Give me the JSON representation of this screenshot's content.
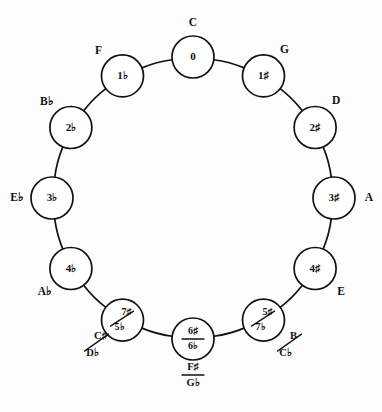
{
  "diagram": {
    "type": "circle-of-fifths",
    "title": "",
    "background_color": "#fdfdfd",
    "stroke_color": "#111111",
    "node_fill": "#ffffff",
    "geometry": {
      "center_x": 193,
      "center_y": 198,
      "ring_radius": 141,
      "node_radius": 21
    },
    "nodes": [
      {
        "id": "c",
        "accidentals": "0",
        "accidentals_second": "",
        "divider": "none",
        "key_label": "C",
        "key_label_second": "",
        "key_divider": "none",
        "angle_deg": 0,
        "label_position": "above"
      },
      {
        "id": "g",
        "accidentals": "1♯",
        "accidentals_second": "",
        "divider": "none",
        "key_label": "G",
        "key_label_second": "",
        "key_divider": "none",
        "angle_deg": 30,
        "label_position": "above-right"
      },
      {
        "id": "d",
        "accidentals": "2♯",
        "accidentals_second": "",
        "divider": "none",
        "key_label": "D",
        "key_label_second": "",
        "key_divider": "none",
        "angle_deg": 60,
        "label_position": "above-right"
      },
      {
        "id": "a",
        "accidentals": "3♯",
        "accidentals_second": "",
        "divider": "none",
        "key_label": "A",
        "key_label_second": "",
        "key_divider": "none",
        "angle_deg": 90,
        "label_position": "right"
      },
      {
        "id": "e",
        "accidentals": "4♯",
        "accidentals_second": "",
        "divider": "none",
        "key_label": "E",
        "key_label_second": "",
        "key_divider": "none",
        "angle_deg": 120,
        "label_position": "below-right"
      },
      {
        "id": "b-cb",
        "accidentals": "5♯",
        "accidentals_second": "7♭",
        "divider": "diagonal",
        "key_label": "B",
        "key_label_second": "C♭",
        "key_divider": "diagonal",
        "angle_deg": 150,
        "label_position": "below-right"
      },
      {
        "id": "fs-gb",
        "accidentals": "6♯",
        "accidentals_second": "6♭",
        "divider": "horizontal",
        "key_label": "F♯",
        "key_label_second": "G♭",
        "key_divider": "horizontal",
        "angle_deg": 180,
        "label_position": "below"
      },
      {
        "id": "cs-db",
        "accidentals": "7♯",
        "accidentals_second": "5♭",
        "divider": "diagonal",
        "key_label": "C♯",
        "key_label_second": "D♭",
        "key_divider": "diagonal",
        "angle_deg": 210,
        "label_position": "below-left"
      },
      {
        "id": "ab",
        "accidentals": "4♭",
        "accidentals_second": "",
        "divider": "none",
        "key_label": "A♭",
        "key_label_second": "",
        "key_divider": "none",
        "angle_deg": 240,
        "label_position": "below-left"
      },
      {
        "id": "eb",
        "accidentals": "3♭",
        "accidentals_second": "",
        "divider": "none",
        "key_label": "E♭",
        "key_label_second": "",
        "key_divider": "none",
        "angle_deg": 270,
        "label_position": "left"
      },
      {
        "id": "bb",
        "accidentals": "2♭",
        "accidentals_second": "",
        "divider": "none",
        "key_label": "B♭",
        "key_label_second": "",
        "key_divider": "none",
        "angle_deg": 300,
        "label_position": "above-left"
      },
      {
        "id": "f",
        "accidentals": "1♭",
        "accidentals_second": "",
        "divider": "none",
        "key_label": "F",
        "key_label_second": "",
        "key_divider": "none",
        "angle_deg": 330,
        "label_position": "above-left"
      }
    ]
  }
}
